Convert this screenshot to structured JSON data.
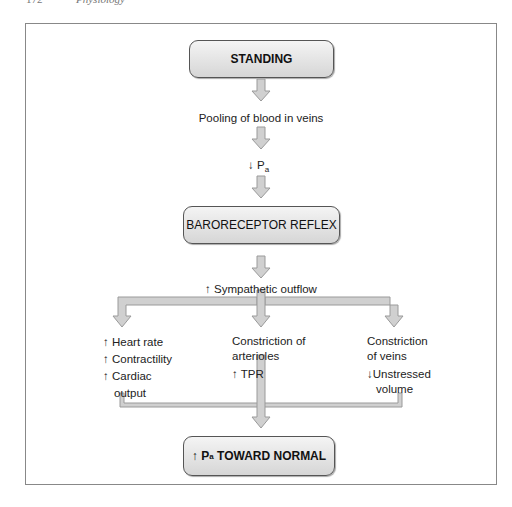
{
  "page_header": {
    "page_number": "172",
    "book_title": "Physiology"
  },
  "diagram": {
    "start_box": "STANDING",
    "step1": "Pooling of blood in veins",
    "step2": {
      "arrow": "↓",
      "symbol": "P",
      "subscript": "a"
    },
    "reflex_box": "BARORECEPTOR REFLEX",
    "step3": {
      "arrow": "↑",
      "text": "Sympathetic outflow"
    },
    "branches": {
      "left": [
        {
          "arrow": "↑",
          "text": "Heart rate"
        },
        {
          "arrow": "↑",
          "text": "Contractility"
        },
        {
          "arrow": "↑",
          "text": "Cardiac",
          "text2": "output"
        }
      ],
      "middle": {
        "line1": "Constriction of",
        "line2": "arterioles",
        "effect_arrow": "↑",
        "effect": "TPR"
      },
      "right": {
        "line1": "Constriction",
        "line2": "of veins",
        "effect_arrow": "↓",
        "effect": "Unstressed",
        "effect2": "volume"
      }
    },
    "end_box": {
      "arrow": "↑",
      "symbol": "P",
      "subscript": "a",
      "text": "TOWARD NORMAL"
    }
  },
  "colors": {
    "arrow_fill": "#d0d0d0",
    "arrow_stroke": "#9a9a9a",
    "frame": "#888888",
    "box_fill": "#e2e2e2"
  }
}
